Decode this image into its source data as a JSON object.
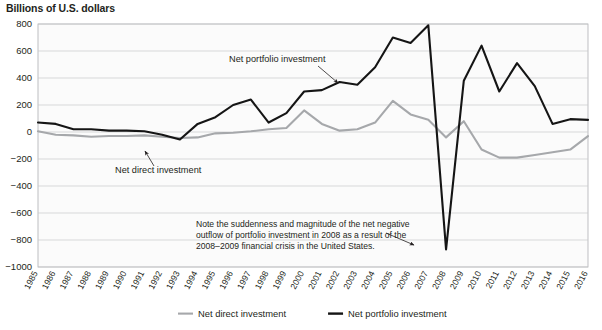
{
  "chart_data": {
    "type": "line",
    "title": "Billions of U.S. dollars",
    "xlabel": "",
    "ylabel": "Billions of U.S. dollars",
    "ylim": [
      -1000,
      800
    ],
    "ytick_step": 200,
    "yticks": [
      800,
      600,
      400,
      200,
      0,
      -200,
      -400,
      -600,
      -800,
      -1000
    ],
    "ytick_labels": [
      "800",
      "600",
      "400",
      "200",
      "0",
      "−200",
      "−400",
      "−600",
      "−800",
      "−1000"
    ],
    "grid": true,
    "legend_position": "bottom",
    "categories": [
      1985,
      1986,
      1987,
      1988,
      1989,
      1990,
      1991,
      1992,
      1993,
      1994,
      1995,
      1996,
      1997,
      1998,
      1999,
      2000,
      2001,
      2002,
      2003,
      2004,
      2005,
      2006,
      2007,
      2008,
      2009,
      2010,
      2011,
      2012,
      2013,
      2014,
      2015,
      2016
    ],
    "xtick_labels": [
      "1985",
      "1986",
      "1987",
      "1988",
      "1989",
      "1990",
      "1991",
      "1992",
      "1993",
      "1994",
      "1995",
      "1996",
      "1997",
      "1998",
      "1999",
      "2000",
      "2001",
      "2002",
      "2003",
      "2004",
      "2005",
      "2006",
      "2007",
      "2008",
      "2009",
      "2010",
      "2011",
      "2012",
      "2013",
      "2014",
      "2015",
      "2016"
    ],
    "series": [
      {
        "name": "Net direct investment",
        "color": "#a6a8ab",
        "values": [
          5,
          -20,
          -25,
          -35,
          -30,
          -30,
          -25,
          -35,
          -45,
          -40,
          -10,
          -5,
          5,
          20,
          30,
          160,
          60,
          10,
          20,
          70,
          230,
          130,
          90,
          -40,
          80,
          -130,
          -190,
          -190,
          -170,
          -150,
          -130,
          -30
        ]
      },
      {
        "name": "Net portfolio investment",
        "color": "#151515",
        "values": [
          70,
          60,
          20,
          20,
          10,
          10,
          5,
          -20,
          -55,
          60,
          110,
          200,
          240,
          70,
          140,
          300,
          310,
          370,
          350,
          480,
          700,
          660,
          790,
          -870,
          380,
          640,
          300,
          510,
          340,
          60,
          95,
          90
        ]
      }
    ],
    "inline_labels": [
      {
        "name": "portfolio-inline-label",
        "text": "Net portfolio investment",
        "x": 229,
        "y": 62,
        "leader": "M 318 66 L 338 83"
      },
      {
        "name": "direct-inline-label",
        "text": "Net direct investment",
        "x": 115,
        "y": 173,
        "leader": "M 154 166 L 145 151"
      }
    ],
    "annotation": {
      "lines": [
        "Note the suddenness and magnitude of the net negative",
        "outflow of portfolio investment in 2008 as a result of the",
        "2008–2009 financial crisis in the United States."
      ],
      "x": 196,
      "y": 227,
      "line_height": 11,
      "leader": "M 386 233 L 414 245"
    },
    "legend": [
      {
        "label": "Net direct investment",
        "color": "#a6a8ab",
        "name": "legend-item-net-direct-investment"
      },
      {
        "label": "Net portfolio investment",
        "color": "#151515",
        "name": "legend-item-net-portfolio-investment"
      }
    ]
  }
}
